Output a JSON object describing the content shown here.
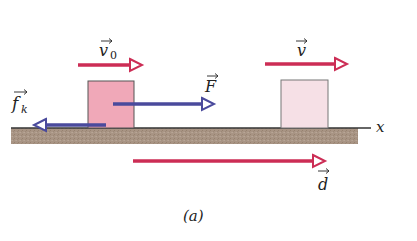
{
  "diagram": {
    "caption": "(a)",
    "axis_label": "x",
    "colors": {
      "velocity_arrow": "#cc2d55",
      "force_arrow": "#4a4a9c",
      "block_initial": "#f0a8b8",
      "block_final": "#f6e0e6",
      "block_border": "#555555",
      "ground": "#a89484",
      "ground_line": "#333333"
    },
    "vectors": {
      "v0": {
        "symbol": "v",
        "subscript": "0"
      },
      "v": {
        "symbol": "v"
      },
      "F": {
        "symbol": "F"
      },
      "fk": {
        "symbol": "f",
        "subscript": "k"
      },
      "d": {
        "symbol": "d"
      }
    }
  }
}
